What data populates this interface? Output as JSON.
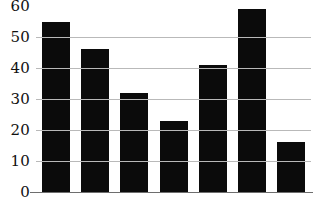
{
  "chart_data": {
    "type": "bar",
    "title": "",
    "subtitle": "",
    "xlabel": "",
    "ylabel": "",
    "categories": [
      "1",
      "2",
      "3",
      "4",
      "5",
      "6",
      "7"
    ],
    "values": [
      55,
      46,
      32,
      23,
      41,
      59,
      16
    ],
    "series": [
      {
        "name": "",
        "values": [
          55,
          46,
          32,
          23,
          41,
          59,
          16
        ]
      }
    ],
    "ylim": [
      0,
      60
    ],
    "yticks": [
      0,
      10,
      20,
      30,
      40,
      50,
      60
    ],
    "ytick_labels": [
      "0",
      "10",
      "20",
      "30",
      "40",
      "50",
      "60"
    ],
    "xticks": [],
    "xtick_labels": [],
    "grid": "horizontal",
    "gridline_values": [
      10,
      20,
      30,
      40,
      50
    ],
    "legend": null,
    "legend_position": "none",
    "annotations": [],
    "bar_color": "#0b0b0b",
    "gridline_color": "#b9b9b9",
    "axis_color": "#6e6e6e",
    "background_color": "#ffffff",
    "bar_count": 7
  }
}
